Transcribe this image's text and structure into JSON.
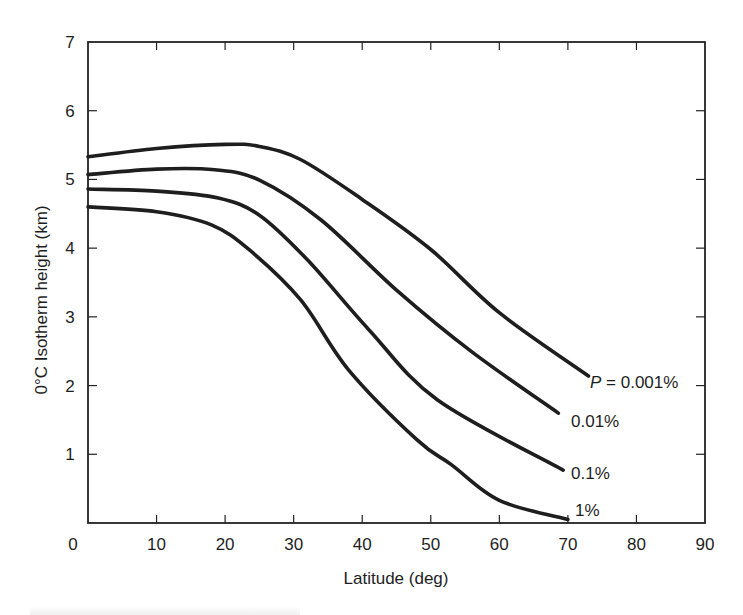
{
  "chart_data": {
    "type": "line",
    "title": "",
    "xlabel": "Latitude (deg)",
    "ylabel": "0°C Isotherm height (km)",
    "xlim": [
      0,
      90
    ],
    "ylim": [
      0,
      7
    ],
    "xticks": [
      0,
      10,
      20,
      30,
      40,
      50,
      60,
      70,
      80,
      90
    ],
    "yticks": [
      1,
      2,
      3,
      4,
      5,
      6,
      7
    ],
    "grid": false,
    "legend": "inline labels at curve ends",
    "series": [
      {
        "name": "P = 0.001%",
        "label": "P = 0.001%",
        "x": [
          0,
          10,
          20,
          25,
          31,
          40,
          50,
          60,
          73
        ],
        "y": [
          5.33,
          5.45,
          5.51,
          5.48,
          5.29,
          4.71,
          3.98,
          3.06,
          2.14
        ]
      },
      {
        "name": "0.01%",
        "label": "0.01%",
        "x": [
          0,
          10,
          18.5,
          25,
          34,
          45,
          56,
          68.6
        ],
        "y": [
          5.07,
          5.15,
          5.14,
          4.99,
          4.41,
          3.39,
          2.49,
          1.6
        ]
      },
      {
        "name": "0.1%",
        "label": "0.1%",
        "x": [
          0,
          10,
          19,
          25,
          32,
          41,
          51,
          69.3
        ],
        "y": [
          4.86,
          4.83,
          4.73,
          4.48,
          3.83,
          2.81,
          1.79,
          0.77
        ]
      },
      {
        "name": "1%",
        "label": "1%",
        "x": [
          0,
          10,
          18,
          23.6,
          31,
          38,
          48,
          53,
          60,
          70
        ],
        "y": [
          4.6,
          4.53,
          4.34,
          3.97,
          3.25,
          2.23,
          1.21,
          0.85,
          0.33,
          0.05
        ]
      }
    ]
  },
  "labels": {
    "p_prefix": "P",
    "p_rest": " = 0.001%",
    "s2": "0.01%",
    "s3": "0.1%",
    "s4": "1%"
  },
  "style": {
    "line_color": "#1e1e1e",
    "axis_color": "#222222",
    "background": "#ffffff"
  }
}
